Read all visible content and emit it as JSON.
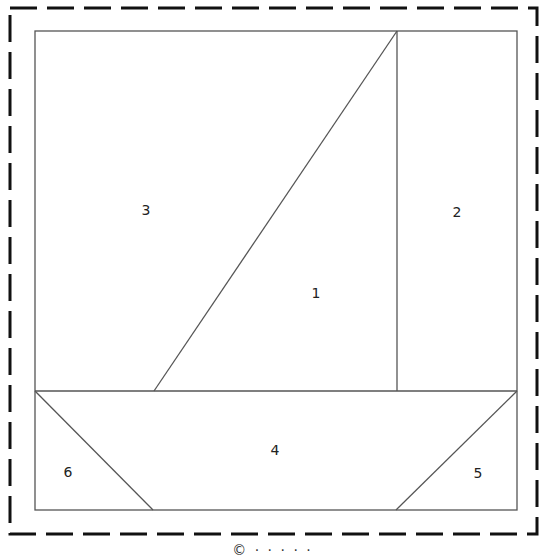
{
  "diagram": {
    "type": "quilt-block-pattern",
    "colors": {
      "line": "#555555",
      "dashed_border": "#111111",
      "background": "#ffffff",
      "label": "#222222"
    },
    "pieces": [
      {
        "id": "1",
        "label": "1",
        "name": "sail",
        "x": 316,
        "y": 293
      },
      {
        "id": "2",
        "label": "2",
        "name": "right-sky",
        "x": 457,
        "y": 212
      },
      {
        "id": "3",
        "label": "3",
        "name": "left-sky",
        "x": 146,
        "y": 210
      },
      {
        "id": "4",
        "label": "4",
        "name": "hull",
        "x": 275,
        "y": 450
      },
      {
        "id": "5",
        "label": "5",
        "name": "bottom-right-corner",
        "x": 478,
        "y": 473
      },
      {
        "id": "6",
        "label": "6",
        "name": "bottom-left-corner",
        "x": 68,
        "y": 472
      }
    ],
    "caption": "© ·  ·  ·  ·  ·"
  }
}
